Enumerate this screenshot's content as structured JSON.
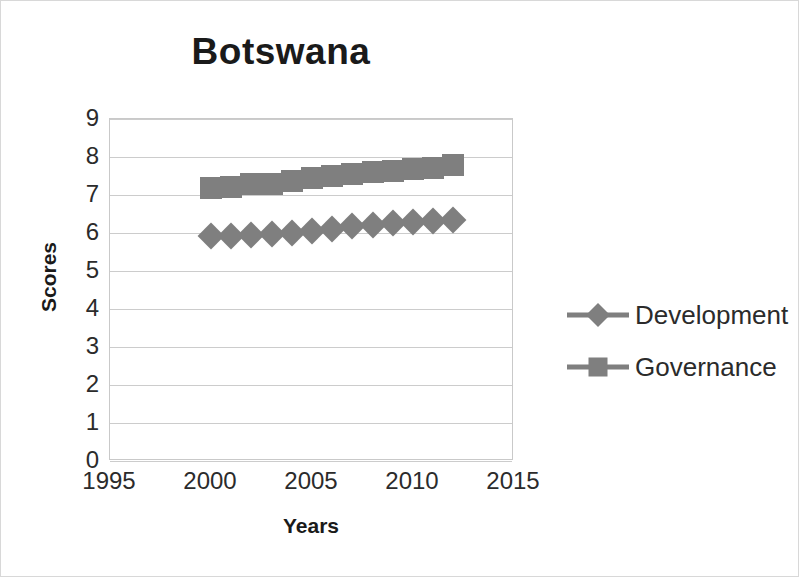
{
  "chart_data": {
    "type": "line",
    "title": "Botswana",
    "xlabel": "Years",
    "ylabel": "Scores",
    "xlim": [
      1995,
      2015
    ],
    "ylim": [
      0,
      9
    ],
    "xticks": [
      1995,
      2000,
      2005,
      2010,
      2015
    ],
    "yticks": [
      0,
      1,
      2,
      3,
      4,
      5,
      6,
      7,
      8,
      9
    ],
    "grid": true,
    "legend_position": "right",
    "x": [
      2000,
      2001,
      2002,
      2003,
      2004,
      2005,
      2006,
      2007,
      2008,
      2009,
      2010,
      2011,
      2012
    ],
    "series": [
      {
        "name": "Development",
        "marker": "diamond",
        "color": "#7f7f7f",
        "values": [
          5.92,
          5.93,
          5.95,
          5.97,
          6.0,
          6.05,
          6.1,
          6.18,
          6.22,
          6.27,
          6.3,
          6.32,
          6.35
        ]
      },
      {
        "name": "Governance",
        "marker": "square",
        "color": "#7f7f7f",
        "values": [
          7.18,
          7.22,
          7.28,
          7.3,
          7.38,
          7.45,
          7.5,
          7.55,
          7.6,
          7.62,
          7.68,
          7.72,
          7.78
        ]
      }
    ]
  },
  "legend": {
    "items": [
      {
        "label": "Development",
        "marker": "diamond"
      },
      {
        "label": "Governance",
        "marker": "square"
      }
    ]
  }
}
